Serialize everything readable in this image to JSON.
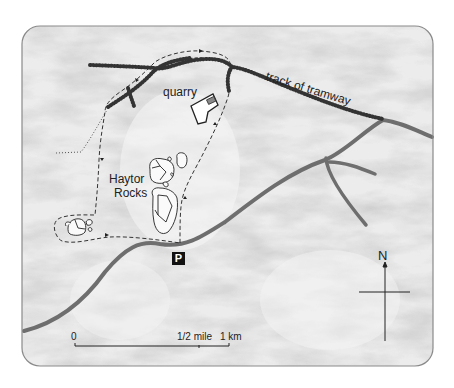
{
  "map": {
    "labels": {
      "quarry": "quarry",
      "tramway": "track of tramway",
      "rocks_line1": "Haytor",
      "rocks_line2": "Rocks",
      "parking": "P",
      "north": "N"
    },
    "scale_bar": {
      "zero": "0",
      "half": "1/2 mile",
      "km": "1 km"
    },
    "colors": {
      "frame": "#8a8a8a",
      "terrain": "#e6e6e6",
      "road": "#6e6e6e",
      "track": "#333333",
      "path": "#333333"
    }
  }
}
